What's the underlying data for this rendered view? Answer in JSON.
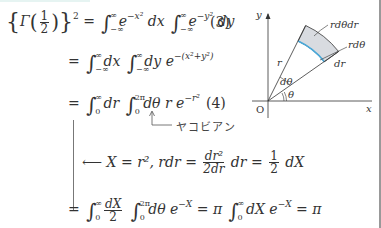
{
  "equations": {
    "line1": {
      "lhs_func": "Γ",
      "lhs_frac_num": "1",
      "lhs_frac_den": "2",
      "lhs_power": "2",
      "eq": "=",
      "int1_upper": "∞",
      "int1_lower": "−∞",
      "int1_body": "e",
      "int1_exp": "−x²",
      "int1_diff": "dx",
      "int2_upper": "∞",
      "int2_lower": "−∞",
      "int2_body": "e",
      "int2_exp": "−y²",
      "int2_diff": "dy",
      "number": "(3)"
    },
    "line2": {
      "eq": "=",
      "int1_upper": "∞",
      "int1_lower": "−∞",
      "int1_diff": "dx",
      "int2_upper": "∞",
      "int2_lower": "−∞",
      "int2_body": "dy e",
      "int2_exp": "−(x²+y²)"
    },
    "line3": {
      "eq": "=",
      "int1_upper": "∞",
      "int1_lower": "0",
      "int1_diff": "dr",
      "int2_upper": "2π",
      "int2_lower": "0",
      "int2_body": "dθ r e",
      "int2_exp": "−r²",
      "number": "(4)"
    },
    "annotation_jacobian": "ヤコビアン",
    "substitution": {
      "arrow": "⟵",
      "text1": "X = r²,",
      "text2": "rdr =",
      "frac1_num": "dr²",
      "frac1_den": "2dr",
      "text3": "dr =",
      "frac2_num": "1",
      "frac2_den": "2",
      "text4": "dX"
    },
    "line4": {
      "eq": "=",
      "int1_upper": "∞",
      "int1_lower": "0",
      "frac_num": "dX",
      "frac_den": "2",
      "int2_upper": "2π",
      "int2_lower": "0",
      "int2_body": "dθ e",
      "int2_exp": "−X",
      "eq2": "= π",
      "int3_upper": "∞",
      "int3_lower": "0",
      "int3_body": "dX e",
      "int3_exp": "−X",
      "result": "= π"
    }
  },
  "diagram": {
    "axis_y": "y",
    "axis_x": "x",
    "origin": "O",
    "radius_label": "r",
    "angle_label": "θ",
    "dtheta_label": "dθ",
    "area_label": "rdθdr",
    "arc_label": "rdθ",
    "dr_label": "dr",
    "colors": {
      "sector_fill": "#d8dbe0",
      "arc_highlight": "#4aa8d8",
      "line": "#333333"
    }
  }
}
